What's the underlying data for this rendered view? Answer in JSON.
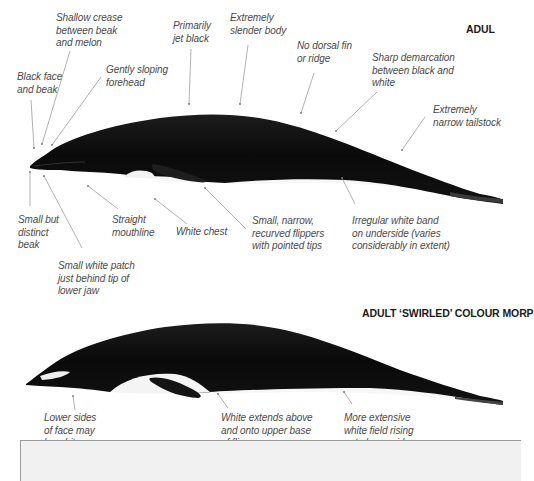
{
  "headings": {
    "adult": "ADUL",
    "swirled": "ADULT ‘SWIRLED’ COLOUR MORP"
  },
  "top_whale": {
    "labels_above": [
      {
        "id": "black-face-beak",
        "text": "Black face\nand beak"
      },
      {
        "id": "shallow-crease",
        "text": "Shallow crease\nbetween beak\nand melon"
      },
      {
        "id": "gently-sloping-forehead",
        "text": "Gently sloping\nforehead"
      },
      {
        "id": "primarily-jet-black",
        "text": "Primarily\njet black"
      },
      {
        "id": "extremely-slender-body",
        "text": "Extremely\nslender body"
      },
      {
        "id": "no-dorsal-fin",
        "text": "No dorsal fin\nor ridge"
      },
      {
        "id": "sharp-demarcation",
        "text": "Sharp demarcation\nbetween black and\nwhite"
      },
      {
        "id": "narrow-tailstock",
        "text": "Extremely\nnarrow tailstock"
      }
    ],
    "labels_below": [
      {
        "id": "small-distinct-beak",
        "text": "Small but\ndistinct\nbeak"
      },
      {
        "id": "small-white-patch",
        "text": "Small white patch\njust behind tip of\nlower jaw"
      },
      {
        "id": "straight-mouthline",
        "text": "Straight\nmouthline"
      },
      {
        "id": "white-chest",
        "text": "White chest"
      },
      {
        "id": "narrow-flippers",
        "text": "Small, narrow,\nrecurved flippers\nwith pointed tips"
      },
      {
        "id": "irregular-white-band",
        "text": "Irregular white band\non underside (varies\nconsiderably in extent)"
      }
    ]
  },
  "bottom_whale": {
    "labels_below": [
      {
        "id": "lower-sides-face",
        "text": "Lower sides\nof face may\nbe white"
      },
      {
        "id": "white-extends-flippers",
        "text": "White extends above\nand onto upper base\nof flippers"
      },
      {
        "id": "extensive-white-field",
        "text": "More extensive\nwhite field rising\nonto lower sides"
      }
    ]
  },
  "colors": {
    "whale_body": "#0c0c0c",
    "leader_line": "#8a8a8a",
    "label_text": "#4a4a4a",
    "heading_text": "#1a1a1a",
    "box_fill": "#f1f1f1"
  }
}
